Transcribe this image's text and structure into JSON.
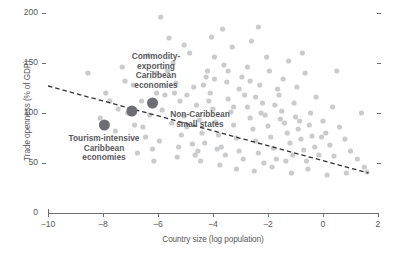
{
  "chart_data": {
    "type": "scatter",
    "title": "",
    "xlabel": "Country size (log population)",
    "ylabel": "Trade openness (% of GDP)",
    "xlim": [
      -10,
      2
    ],
    "ylim": [
      0,
      200
    ],
    "xticks": [
      -10,
      -8,
      -6,
      -4,
      -2,
      0,
      2
    ],
    "xtick_labels": [
      "−10",
      "−8",
      "−6",
      "−4",
      "−2",
      "0",
      "2"
    ],
    "yticks": [
      0,
      50,
      100,
      150,
      200
    ],
    "ytick_labels": [
      "0",
      "50",
      "100",
      "150",
      "200"
    ],
    "grid": false,
    "legend": null,
    "right_axis_ticks": [
      50,
      100,
      150,
      200
    ],
    "trendline": {
      "type": "dashed-linear",
      "x_start": -10,
      "y_start": 127,
      "x_end": 1.65,
      "y_end": 40,
      "color": "#333333"
    },
    "series": [
      {
        "name": "countries",
        "color": "#c9cbcd",
        "marker_size": 2.6,
        "points": [
          [
            -8.55,
            140
          ],
          [
            -8.1,
            95
          ],
          [
            -7.55,
            82
          ],
          [
            -7.1,
            100
          ],
          [
            -6.85,
            88
          ],
          [
            -6.45,
            76
          ],
          [
            -6.2,
            64
          ],
          [
            -5.9,
            196
          ],
          [
            -5.75,
            118
          ],
          [
            -5.6,
            175
          ],
          [
            -5.45,
            150
          ],
          [
            -5.35,
            130
          ],
          [
            -5.2,
            112
          ],
          [
            -5.05,
            97
          ],
          [
            -4.95,
            86
          ],
          [
            -4.85,
            160
          ],
          [
            -4.7,
            126
          ],
          [
            -4.6,
            108
          ],
          [
            -4.5,
            93
          ],
          [
            -4.4,
            80
          ],
          [
            -4.3,
            70
          ],
          [
            -4.2,
            142
          ],
          [
            -4.1,
            120
          ],
          [
            -4.0,
            104
          ],
          [
            -3.9,
            91
          ],
          [
            -3.8,
            78
          ],
          [
            -3.7,
            66
          ],
          [
            -3.6,
            148
          ],
          [
            -3.5,
            131
          ],
          [
            -3.45,
            114
          ],
          [
            -3.35,
            101
          ],
          [
            -3.25,
            88
          ],
          [
            -3.15,
            75
          ],
          [
            -3.05,
            62
          ],
          [
            -2.95,
            136
          ],
          [
            -2.85,
            118
          ],
          [
            -2.75,
            106
          ],
          [
            -2.65,
            95
          ],
          [
            -2.55,
            84
          ],
          [
            -2.45,
            72
          ],
          [
            -2.35,
            60
          ],
          [
            -2.3,
            128
          ],
          [
            -2.2,
            110
          ],
          [
            -2.1,
            98
          ],
          [
            -2.0,
            87
          ],
          [
            -1.9,
            76
          ],
          [
            -1.8,
            65
          ],
          [
            -1.7,
            54
          ],
          [
            -1.6,
            118
          ],
          [
            -1.5,
            102
          ],
          [
            -1.4,
            90
          ],
          [
            -1.3,
            80
          ],
          [
            -1.2,
            70
          ],
          [
            -1.1,
            58
          ],
          [
            -1.0,
            96
          ],
          [
            -0.9,
            84
          ],
          [
            -0.8,
            74
          ],
          [
            -0.7,
            63
          ],
          [
            -0.6,
            52
          ],
          [
            -0.5,
            88
          ],
          [
            -0.4,
            77
          ],
          [
            -0.3,
            66
          ],
          [
            -0.15,
            58
          ],
          [
            0.0,
            92
          ],
          [
            0.1,
            80
          ],
          [
            0.25,
            68
          ],
          [
            0.4,
            57
          ],
          [
            0.6,
            86
          ],
          [
            0.8,
            74
          ],
          [
            1.0,
            62
          ],
          [
            1.25,
            54
          ],
          [
            1.5,
            46
          ],
          [
            1.6,
            41
          ],
          [
            -7.3,
            146
          ],
          [
            -6.9,
            128
          ],
          [
            -6.6,
            112
          ],
          [
            -6.3,
            98
          ],
          [
            -6.05,
            140
          ],
          [
            -5.85,
            103
          ],
          [
            -5.5,
            90
          ],
          [
            -5.15,
            78
          ],
          [
            -4.75,
            69
          ],
          [
            -3.95,
            156
          ],
          [
            -3.3,
            166
          ],
          [
            -2.6,
            172
          ],
          [
            -1.95,
            142
          ],
          [
            -1.45,
            134
          ],
          [
            -0.95,
            126
          ],
          [
            -0.25,
            116
          ],
          [
            0.35,
            106
          ],
          [
            -4.45,
            52
          ],
          [
            -3.75,
            48
          ],
          [
            -3.15,
            44
          ],
          [
            -2.5,
            42
          ],
          [
            -1.85,
            46
          ],
          [
            -1.15,
            40
          ],
          [
            -0.55,
            44
          ],
          [
            0.15,
            38
          ],
          [
            0.85,
            40
          ],
          [
            -6.75,
            60
          ],
          [
            -6.15,
            52
          ],
          [
            -5.3,
            56
          ],
          [
            -4.65,
            58
          ],
          [
            -3.55,
            58
          ],
          [
            -2.9,
            54
          ],
          [
            -2.15,
            50
          ],
          [
            -1.35,
            52
          ],
          [
            -7.75,
            112
          ],
          [
            -7.45,
            104
          ],
          [
            -6.55,
            86
          ],
          [
            -5.95,
            72
          ],
          [
            -5.25,
            66
          ],
          [
            -4.55,
            62
          ],
          [
            -3.85,
            64
          ],
          [
            -3.05,
            124
          ],
          [
            -2.45,
            116
          ],
          [
            -1.75,
            108
          ],
          [
            -1.05,
            110
          ],
          [
            -0.45,
            100
          ],
          [
            -5.65,
            142
          ],
          [
            -4.25,
            136
          ],
          [
            -3.45,
            142
          ],
          [
            -2.75,
            146
          ],
          [
            -2.05,
            156
          ],
          [
            -1.25,
            152
          ],
          [
            -0.65,
            140
          ],
          [
            -4.95,
            118
          ],
          [
            -4.15,
            112
          ],
          [
            -3.25,
            106
          ],
          [
            -2.25,
            100
          ],
          [
            -1.55,
            94
          ],
          [
            -0.85,
            92
          ],
          [
            -0.05,
            76
          ],
          [
            -6.35,
            158
          ],
          [
            -5.05,
            168
          ],
          [
            -4.05,
            176
          ],
          [
            -3.65,
            184
          ],
          [
            -2.35,
            186
          ],
          [
            -0.75,
            160
          ],
          [
            0.5,
            142
          ],
          [
            1.4,
            100
          ],
          [
            -7.9,
            120
          ],
          [
            -7.2,
            132
          ],
          [
            -6.05,
            120
          ],
          [
            -5.4,
            120
          ],
          [
            -4.35,
            128
          ],
          [
            -3.95,
            134
          ],
          [
            -2.65,
            132
          ],
          [
            -1.65,
            124
          ]
        ]
      },
      {
        "name": "highlighted economies",
        "color": "#6d6e71",
        "marker_size": 5.5,
        "points": [
          {
            "label": "Tourism-intensive Caribbean economies",
            "x": -7.95,
            "y": 88
          },
          {
            "label": "Non-Caribbean small states",
            "x": -6.95,
            "y": 102
          },
          {
            "label": "Commodity-exporting Caribbean economies",
            "x": -6.2,
            "y": 110
          }
        ]
      }
    ],
    "annotations": [
      {
        "id": "commodity",
        "text": "Commodity-\nexporting\nCaribbean\neconomies"
      },
      {
        "id": "noncaribbean",
        "text": "Non-Caribbean\nsmall states"
      },
      {
        "id": "tourism",
        "text": "Tourism-intensive\nCaribbean\neconomies"
      }
    ]
  }
}
